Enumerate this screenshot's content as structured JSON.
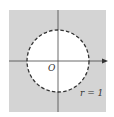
{
  "figure": {
    "origin_label": "O",
    "radius_label": "r = 1",
    "colors": {
      "background": "#ffffff",
      "shaded_region": "#d4d4d4",
      "disk": "#ffffff",
      "axes": "#444444",
      "circle_dash": "#333333"
    },
    "axes": {
      "horizontal_arrow": true,
      "vertical_arrow": false
    },
    "circle": {
      "style": "dashed",
      "radius": 1
    }
  }
}
